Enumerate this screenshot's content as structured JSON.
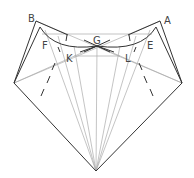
{
  "diagram": {
    "type": "geometric-construction",
    "labels": {
      "A": "A",
      "B": "B",
      "E": "E",
      "F": "F",
      "G": "G",
      "K": "K",
      "L": "L"
    },
    "points": {
      "A": [
        160,
        21
      ],
      "B": [
        36,
        21
      ],
      "G": [
        97,
        46
      ],
      "left": [
        14,
        83
      ],
      "right": [
        182,
        83
      ],
      "bottom": [
        96,
        171
      ]
    },
    "colors": {
      "stroke_dark": "#333333",
      "stroke_light": "#999999",
      "label": "#444444"
    }
  }
}
